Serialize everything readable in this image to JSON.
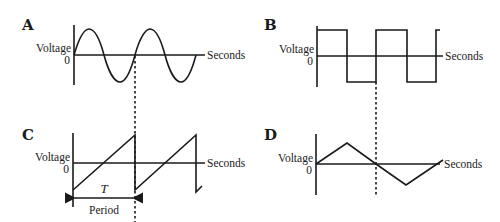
{
  "panels": [
    {
      "id": "A",
      "label": "A",
      "waveform": "sine",
      "y_label": "Voltage",
      "zero_label": "0",
      "x_label": "Seconds"
    },
    {
      "id": "B",
      "label": "B",
      "waveform": "square",
      "y_label": "Voltage",
      "zero_label": "0",
      "x_label": "Seconds"
    },
    {
      "id": "C",
      "label": "C",
      "waveform": "sawtooth",
      "y_label": "Voltage",
      "zero_label": "0",
      "x_label": "Seconds",
      "period_symbol": "T",
      "period_label": "Period"
    },
    {
      "id": "D",
      "label": "D",
      "waveform": "triangle",
      "y_label": "Voltage",
      "zero_label": "0",
      "x_label": "Seconds"
    }
  ],
  "colors": {
    "ink": "#1a1a1a",
    "background": "#ffffff"
  }
}
